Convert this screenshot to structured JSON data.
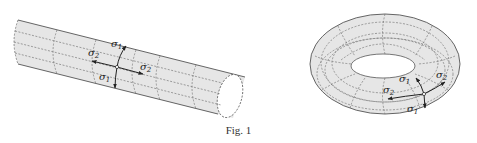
{
  "figure": {
    "caption": "Fig. 1",
    "colors": {
      "surface": "#e8e8e8",
      "outline": "#555555",
      "grid": "#666666",
      "arrow": "#222222"
    },
    "cylinder": {
      "labels": {
        "sigma1_top": "σ",
        "sigma1_top_sub": "1",
        "sigma2_left": "σ",
        "sigma2_left_sub": "2",
        "sigma2_right": "σ",
        "sigma2_right_sub": "2",
        "sigma1_bottom": "σ",
        "sigma1_bottom_sub": "1"
      }
    },
    "torus": {
      "labels": {
        "sigma1_top": "σ",
        "sigma1_top_sub": "1",
        "sigma2_right": "σ",
        "sigma2_right_sub": "2",
        "sigma2_left": "σ",
        "sigma2_left_sub": "2",
        "sigma1_bottom": "σ",
        "sigma1_bottom_sub": "1"
      }
    }
  }
}
